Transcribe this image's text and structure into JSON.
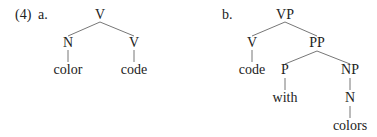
{
  "example_number": "(4)",
  "tree_a": {
    "label": "a.",
    "root": "V",
    "left_node": "N",
    "right_node": "V",
    "left_leaf": "color",
    "right_leaf": "code"
  },
  "tree_b": {
    "label": "b.",
    "root": "VP",
    "v_node": "V",
    "v_leaf": "code",
    "pp_node": "PP",
    "p_node": "P",
    "p_leaf": "with",
    "np_node": "NP",
    "n_node": "N",
    "n_leaf": "colors"
  },
  "colors": {
    "text": "#222222",
    "branch": "#777777",
    "background": "#ffffff"
  }
}
